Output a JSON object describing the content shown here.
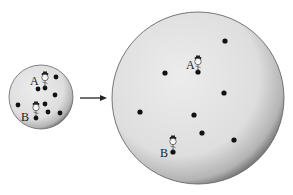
{
  "diagram": {
    "type": "expanding-universe-illustration",
    "colors": {
      "background": "#ffffff",
      "disc_light": "#e6e6e6",
      "disc_dark": "#8a8a8a",
      "dot": "#111111",
      "arrow": "#222222"
    },
    "small_disc": {
      "center": [
        41,
        97
      ],
      "radius": 32,
      "label_a": "A",
      "label_b": "B",
      "dots": [
        [
          45,
          88
        ],
        [
          56,
          77
        ],
        [
          38,
          89
        ],
        [
          55,
          95
        ],
        [
          18,
          105
        ],
        [
          45,
          104
        ],
        [
          48,
          112
        ],
        [
          60,
          113
        ],
        [
          36,
          118
        ]
      ],
      "a_dot": [
        45,
        88
      ],
      "b_dot": [
        36,
        118
      ],
      "a_label_pos": [
        30,
        85
      ],
      "b_label_pos": [
        21,
        121
      ]
    },
    "arrow": {
      "from": [
        80,
        98
      ],
      "to": [
        107,
        98
      ]
    },
    "large_disc": {
      "center": [
        198,
        98
      ],
      "radius": 86,
      "label_a": "A",
      "label_b": "B",
      "dots": [
        [
          225,
          41
        ],
        [
          198,
          72
        ],
        [
          165,
          73
        ],
        [
          224,
          93
        ],
        [
          140,
          112
        ],
        [
          194,
          115
        ],
        [
          202,
          133
        ],
        [
          234,
          140
        ],
        [
          173,
          152
        ]
      ],
      "a_dot": [
        198,
        72
      ],
      "b_dot": [
        173,
        152
      ],
      "a_label_pos": [
        186,
        69
      ],
      "b_label_pos": [
        160,
        157
      ]
    }
  }
}
